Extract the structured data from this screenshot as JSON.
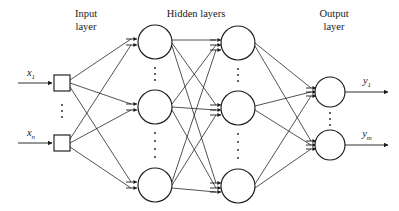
{
  "figure": {
    "type": "neural-network-diagram",
    "background_color": "#ffffff",
    "stroke_color": "#1a1a1a"
  },
  "titles": {
    "input_line1": "Input",
    "input_line2": "layer",
    "hidden": "Hidden layers",
    "output_line1": "Output",
    "output_line2": "layer"
  },
  "inputs": {
    "label_first_base": "x",
    "label_first_sub": "1",
    "label_last_base": "x",
    "label_last_sub": "n",
    "ellipsis": "⋮"
  },
  "outputs": {
    "label_first_base": "y",
    "label_first_sub": "1",
    "label_last_base": "y",
    "label_last_sub": "m",
    "ellipsis": "⋮"
  },
  "layers": {
    "input": {
      "name": "input-layer",
      "node_shape": "square",
      "visible_nodes": 2,
      "ellipsis": true
    },
    "hidden1": {
      "name": "hidden-layer-1",
      "node_shape": "circle",
      "visible_nodes": 3,
      "ellipsis": true
    },
    "hidden2": {
      "name": "hidden-layer-2",
      "node_shape": "circle",
      "visible_nodes": 3,
      "ellipsis": true
    },
    "output": {
      "name": "output-layer",
      "node_shape": "circle",
      "visible_nodes": 2,
      "ellipsis": true
    }
  },
  "geometry": {
    "input_x": 62,
    "hidden1_x": 155,
    "hidden2_x": 238,
    "output_x": 330,
    "input_square_size": 16,
    "hidden_radius": 17,
    "output_radius": 15,
    "input_rows": [
      83,
      143
    ],
    "hidden_rows": [
      42,
      107,
      185
    ],
    "output_rows": [
      92,
      145
    ]
  }
}
